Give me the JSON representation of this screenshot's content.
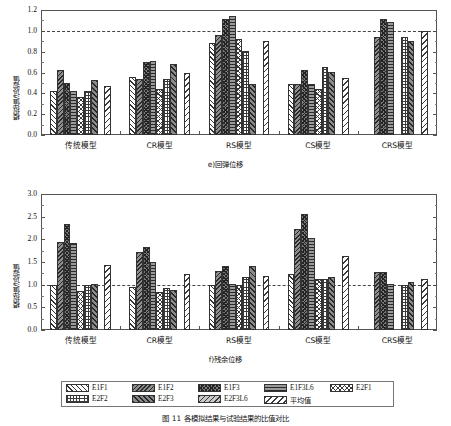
{
  "figure": {
    "caption": "图 11 各模拟结果与试验结果的比值对比"
  },
  "legend": {
    "items": [
      {
        "key": "e1f1",
        "label": "E1F1"
      },
      {
        "key": "e1f2",
        "label": "E1F2"
      },
      {
        "key": "e1f3",
        "label": "E1F3"
      },
      {
        "key": "e1f3l6",
        "label": "E1F3L6"
      },
      {
        "key": "e2f1",
        "label": "E2F1"
      },
      {
        "key": "e2f2",
        "label": "E2F2"
      },
      {
        "key": "e2f3",
        "label": "E2F3"
      },
      {
        "key": "e2f3l6",
        "label": "E2F3L6"
      },
      {
        "key": "avg",
        "label": "平均值"
      }
    ]
  },
  "chart_data": [
    {
      "id": "subplot-e",
      "type": "bar",
      "title": "e)回弹位移",
      "xlabel": "",
      "ylabel": "模拟值/试验值",
      "ylim": [
        0.0,
        1.2
      ],
      "yticks": [
        0.0,
        0.2,
        0.4,
        0.6,
        0.8,
        1.0,
        1.2
      ],
      "ytick_labels": [
        "0.0",
        "0.2",
        "0.4",
        "0.6",
        "0.8",
        "1.0",
        "1.2"
      ],
      "reference_line": 1.0,
      "grid": false,
      "legend_position": "below-figure",
      "categories": [
        "传统模型",
        "CR模型",
        "RS模型",
        "CS模型",
        "CRS模型"
      ],
      "series": [
        {
          "name": "E1F1",
          "values": [
            0.425,
            0.56,
            0.88,
            0.485,
            null
          ]
        },
        {
          "name": "E1F2",
          "values": [
            0.625,
            0.535,
            0.96,
            0.49,
            0.945
          ]
        },
        {
          "name": "E1F3",
          "values": [
            0.5,
            0.7,
            1.11,
            0.625,
            1.11
          ]
        },
        {
          "name": "E1F3L6",
          "values": [
            0.42,
            0.715,
            1.14,
            0.485,
            1.085
          ]
        },
        {
          "name": "E2F1",
          "values": [
            0.365,
            0.445,
            0.92,
            0.445,
            null
          ]
        },
        {
          "name": "E2F2",
          "values": [
            0.42,
            0.54,
            0.805,
            0.655,
            0.945
          ]
        },
        {
          "name": "E2F3",
          "values": [
            0.525,
            0.68,
            0.49,
            0.605,
            0.9
          ]
        },
        {
          "name": "E2F3L6",
          "values": [
            null,
            null,
            null,
            null,
            null
          ]
        },
        {
          "name": "平均值",
          "values": [
            0.47,
            0.595,
            0.9,
            0.545,
            1.0
          ]
        }
      ]
    },
    {
      "id": "subplot-f",
      "type": "bar",
      "title": "f)残余位移",
      "xlabel": "",
      "ylabel": "模拟值/试验值",
      "ylim": [
        0.0,
        3.0
      ],
      "yticks": [
        0.0,
        0.5,
        1.0,
        1.5,
        2.0,
        2.5,
        3.0
      ],
      "ytick_labels": [
        "0.0",
        "0.5",
        "1.0",
        "1.5",
        "2.0",
        "2.5",
        "3.0"
      ],
      "reference_line": 1.0,
      "grid": false,
      "legend_position": "below-figure",
      "categories": [
        "传统模型",
        "CR模型",
        "RS模型",
        "CS模型",
        "CRS模型"
      ],
      "series": [
        {
          "name": "E1F1",
          "values": [
            1.0,
            0.95,
            1.0,
            1.225,
            null
          ]
        },
        {
          "name": "E1F2",
          "values": [
            1.945,
            1.72,
            1.295,
            2.225,
            1.28
          ]
        },
        {
          "name": "E1F3",
          "values": [
            2.33,
            1.84,
            1.405,
            2.55,
            1.275
          ]
        },
        {
          "name": "E1F3L6",
          "values": [
            1.91,
            1.505,
            1.01,
            2.03,
            1.005
          ]
        },
        {
          "name": "E2F1",
          "values": [
            0.855,
            0.84,
            1.0,
            1.125,
            null
          ]
        },
        {
          "name": "E2F2",
          "values": [
            1.0,
            0.935,
            1.175,
            1.12,
            1.0
          ]
        },
        {
          "name": "E2F3",
          "values": [
            1.005,
            0.88,
            1.415,
            1.16,
            1.05
          ]
        },
        {
          "name": "E2F3L6",
          "values": [
            null,
            null,
            null,
            null,
            null
          ]
        },
        {
          "name": "平均值",
          "values": [
            1.44,
            1.23,
            1.19,
            1.625,
            1.13
          ]
        }
      ]
    }
  ]
}
